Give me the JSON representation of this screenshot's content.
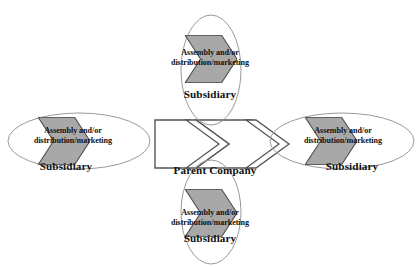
{
  "diagram": {
    "type": "organizational-network",
    "colors": {
      "chevron_fill": "#a8a8a8",
      "chevron_stroke": "#555555",
      "ellipse_stroke": "#9a9a9a",
      "center_fill": "#ffffff",
      "center_stroke": "#555555",
      "text": "#111111",
      "background": "#ffffff"
    },
    "center": {
      "label": "Parent Company",
      "shape": "double-chevron",
      "fill": "white"
    },
    "nodes": [
      {
        "id": "subsidiary-left",
        "position": "left",
        "role_label": "Subsidiary",
        "flow_label_line1": "Assembly and/or",
        "flow_label_line2": "distribution/marketing",
        "shape": "ellipse-horizontal",
        "arrow_direction": "right"
      },
      {
        "id": "subsidiary-top",
        "position": "top",
        "role_label": "Subsidiary",
        "flow_label_line1": "Assembly and/or",
        "flow_label_line2": "distribution/marketing",
        "shape": "ellipse-vertical",
        "arrow_direction": "right"
      },
      {
        "id": "subsidiary-right",
        "position": "right",
        "role_label": "Subsidiary",
        "flow_label_line1": "Assembly and/or",
        "flow_label_line2": "distribution/marketing",
        "shape": "ellipse-horizontal",
        "arrow_direction": "right"
      },
      {
        "id": "subsidiary-bottom",
        "position": "bottom",
        "role_label": "Subsidiary",
        "flow_label_line1": "Assembly and/or",
        "flow_label_line2": "distribution/marketing",
        "shape": "ellipse-vertical",
        "arrow_direction": "right"
      }
    ]
  }
}
